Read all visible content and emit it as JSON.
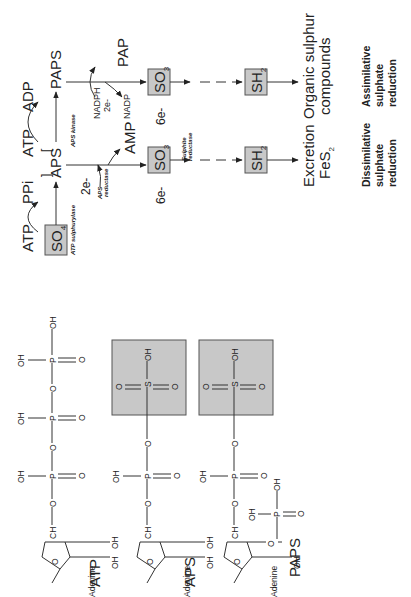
{
  "pathway": {
    "nodes": {
      "so4": "SO",
      "so4_sub": "4",
      "atp_in": "ATP",
      "ppi": "PPi",
      "aps": "APS",
      "atp_kinase": "ATP",
      "adp": "ADP",
      "paps": "PAPS",
      "nadph": "NADPH",
      "nadph_e": "2e-",
      "nadp": "NADP",
      "pap": "PAP",
      "two_e": "2e-",
      "amp": "AMP",
      "so3_dissim": "SO",
      "so3_dissim_sub": "3",
      "so3_assim": "SO",
      "so3_assim_sub": "3",
      "six_e_dissim": "6e-",
      "six_e_assim": "6e-",
      "sh2_dissim": "SH",
      "sh2_dissim_sub": "2",
      "sh2_assim": "SH",
      "sh2_assim_sub": "2",
      "excretion": "Excretion",
      "fes2": "FeS",
      "fes2_sub": "2",
      "organic_1": "Organic sulphur",
      "organic_2": "compounds"
    },
    "enzymes": {
      "atp_sulphurylase": "ATP sulphurylase",
      "aps_kinase": "APS kinase",
      "aps_reductase_1": "APS",
      "aps_reductase_2": "reductase",
      "sulphite_reductase_1": "Sulphite",
      "sulphite_reductase_2": "reductase"
    },
    "bracket_open": "[",
    "bracket_close": "]",
    "labels": {
      "dissimilative": [
        "Dissimilative",
        "sulphate",
        "reduction"
      ],
      "assimilative": [
        "Assimilative",
        "sulphate",
        "reduction"
      ]
    }
  },
  "structures": {
    "atp": {
      "name": "ATP",
      "base": "Adenine"
    },
    "aps": {
      "name": "APS",
      "base": "Adenine"
    },
    "paps": {
      "name": "PAPS",
      "base": "Adenine"
    },
    "atoms": {
      "oh": "OH",
      "o": "O",
      "p": "P",
      "s": "S",
      "ch2": "CH",
      "ch2_sub": "2"
    }
  },
  "colors": {
    "box_fill": "#c8c8c8",
    "box_stroke": "#555555",
    "line": "#333333",
    "text": "#222222"
  }
}
